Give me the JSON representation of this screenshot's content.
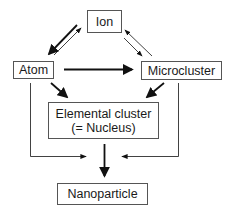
{
  "diagram": {
    "type": "flow-diagram",
    "nodes": {
      "ion": {
        "label": "Ion"
      },
      "atom": {
        "label": "Atom"
      },
      "microcluster": {
        "label": "Microcluster"
      },
      "elemental_cluster": {
        "label_line1": "Elemental cluster",
        "label_line2": "(= Nucleus)"
      },
      "nanoparticle": {
        "label": "Nanoparticle"
      }
    },
    "edges": [
      {
        "from": "Ion",
        "to": "Atom",
        "weight": "thick"
      },
      {
        "from": "Atom",
        "to": "Ion",
        "weight": "thin"
      },
      {
        "from": "Microcluster",
        "to": "Ion",
        "weight": "thin"
      },
      {
        "from": "Ion",
        "to": "Microcluster",
        "weight": "thin"
      },
      {
        "from": "Atom",
        "to": "Microcluster",
        "weight": "thick"
      },
      {
        "from": "Atom",
        "to": "Elemental cluster (= Nucleus)",
        "weight": "thick"
      },
      {
        "from": "Microcluster",
        "to": "Elemental cluster (= Nucleus)",
        "weight": "thick"
      },
      {
        "from": "Elemental cluster (= Nucleus)",
        "to": "Nanoparticle",
        "weight": "thick"
      },
      {
        "from": "Atom",
        "to": "Nanoparticle",
        "weight": "thin"
      },
      {
        "from": "Microcluster",
        "to": "Nanoparticle",
        "weight": "thin"
      }
    ],
    "colors": {
      "line": "#111111",
      "box_border": "#555555",
      "background": "#ffffff"
    }
  }
}
